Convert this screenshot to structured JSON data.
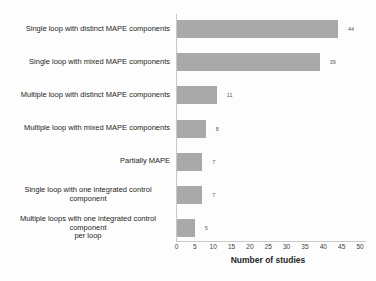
{
  "chart_data": {
    "type": "bar",
    "orientation": "horizontal",
    "title": "",
    "xlabel": "Number of studies",
    "ylabel": "",
    "xlim": [
      0,
      50
    ],
    "xticks": [
      0,
      5,
      10,
      15,
      20,
      25,
      30,
      35,
      40,
      45,
      50
    ],
    "grid": false,
    "legend": false,
    "data_labels_position": "outside-end",
    "bar_color": "#a9a9a9",
    "axis_line_color": "#c9c9c9",
    "categories": [
      "Single loop with distinct MAPE components",
      "Single loop with mixed MAPE components",
      "Multiple loop with distinct MAPE components",
      "Multiple loop with mixed MAPE components",
      "Partially MAPE",
      "Single loop with one integrated control component",
      "Multiple loops with one integrated control component\nper loop"
    ],
    "values": [
      44,
      39,
      11,
      8,
      7,
      7,
      5
    ]
  }
}
